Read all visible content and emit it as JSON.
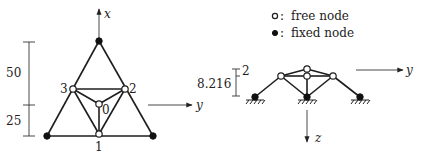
{
  "legend": {
    "free_label": "free node",
    "fixed_label": "fixed node",
    "separator": ":"
  },
  "top_view": {
    "axes": {
      "x_label": "x",
      "y_label": "y"
    },
    "dimensions": {
      "upper": "50",
      "lower": "25"
    },
    "node_labels": {
      "n0": "0",
      "n1": "1",
      "n2": "2",
      "n3": "3"
    }
  },
  "side_view": {
    "axes": {
      "y_label": "y",
      "z_label": "z"
    },
    "dimensions": {
      "height": "8.216",
      "top_offset": "2"
    }
  },
  "colors": {
    "ink": "#1e1e1e",
    "background": "#ffffff"
  }
}
